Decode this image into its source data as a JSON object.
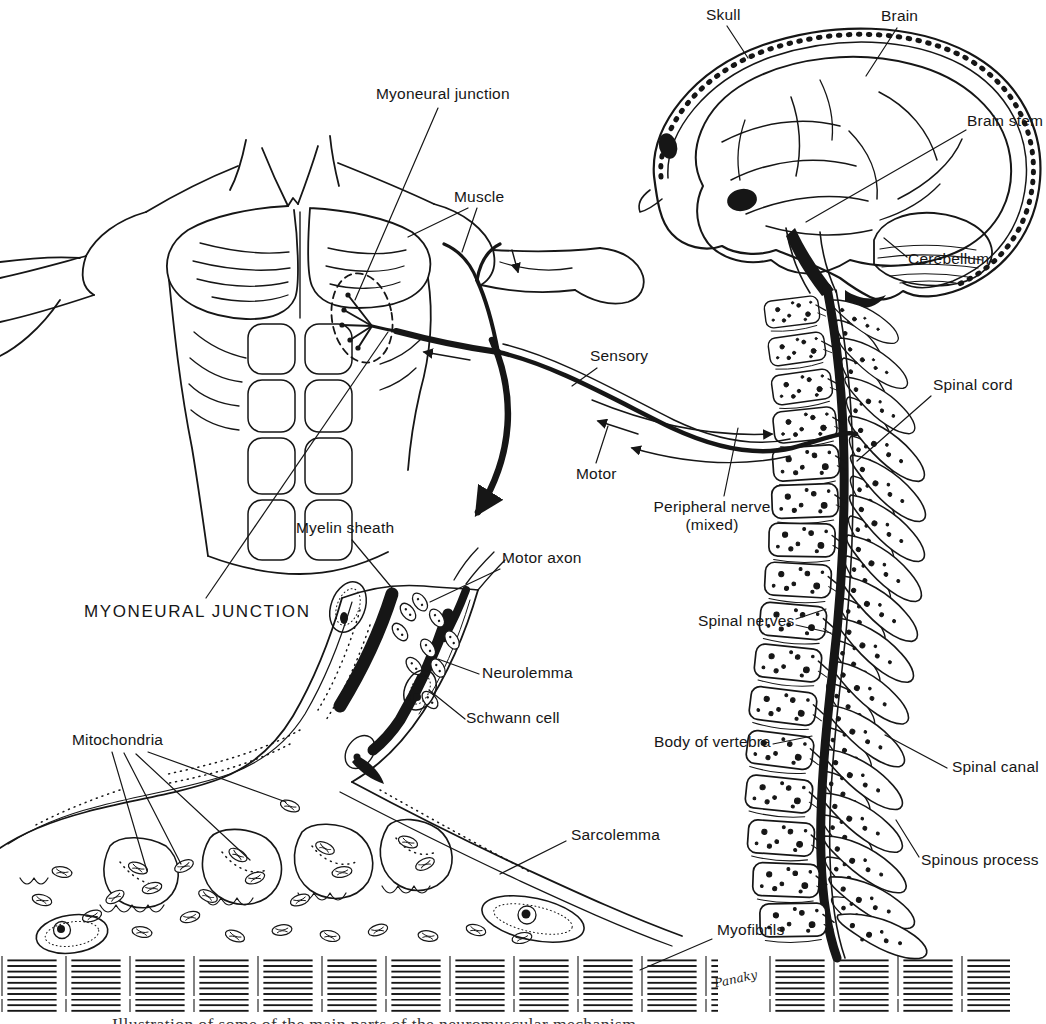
{
  "figure": {
    "background_color": "#ffffff",
    "ink_color": "#161616",
    "caption_fragment": "Illustration of some of the main parts of the neuromuscular mechanism",
    "artist_signature": "Panaky"
  },
  "labels": {
    "skull": "Skull",
    "brain": "Brain",
    "brain_stem": "Brain stem",
    "cerebellum": "Cerebellum",
    "myoneural_junction": "Myoneural junction",
    "muscle": "Muscle",
    "sensory": "Sensory",
    "motor": "Motor",
    "peripheral_nerve_line1": "Peripheral nerve",
    "peripheral_nerve_line2": "(mixed)",
    "spinal_cord": "Spinal cord",
    "spinal_nerves": "Spinal nerves",
    "body_of_vertebra": "Body of vertebra",
    "spinal_canal": "Spinal canal",
    "spinous_process": "Spinous process",
    "myoneural_junction_caps": "MYONEURAL JUNCTION",
    "myelin_sheath": "Myelin sheath",
    "motor_axon": "Motor axon",
    "neurolemma": "Neurolemma",
    "schwann_cell": "Schwann cell",
    "mitochondria": "Mitochondria",
    "sarcolemma": "Sarcolemma",
    "myofibrils": "Myofibrils"
  }
}
